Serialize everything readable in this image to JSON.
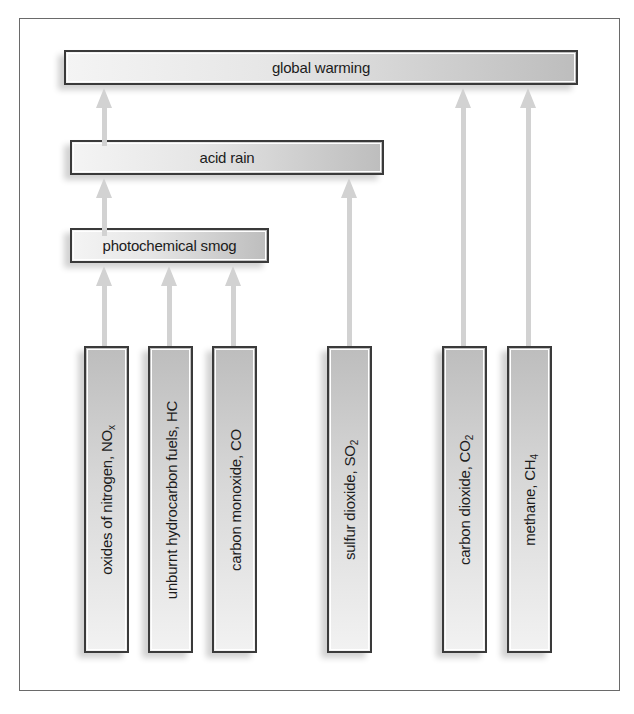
{
  "diagram": {
    "effects": [
      {
        "id": "global-warming",
        "label": "global warming"
      },
      {
        "id": "acid-rain",
        "label": "acid rain"
      },
      {
        "id": "photochemical-smog",
        "label": "photochemical smog"
      }
    ],
    "pollutants": [
      {
        "id": "nox",
        "label": "oxides of nitrogen, NO",
        "sub": "x",
        "leads_to": "photochemical smog"
      },
      {
        "id": "hc",
        "label": "unburnt hydrocarbon fuels, HC",
        "sub": "",
        "leads_to": "photochemical smog"
      },
      {
        "id": "co",
        "label": "carbon monoxide, CO",
        "sub": "",
        "leads_to": "photochemical smog"
      },
      {
        "id": "so2",
        "label": "sulfur dioxide, SO",
        "sub": "2",
        "leads_to": "acid rain"
      },
      {
        "id": "co2",
        "label": "carbon dioxide, CO",
        "sub": "2",
        "leads_to": "global warming"
      },
      {
        "id": "ch4",
        "label": "methane, CH",
        "sub": "4",
        "leads_to": "global warming"
      }
    ],
    "links": [
      {
        "from": "photochemical smog",
        "to": "acid rain"
      },
      {
        "from": "acid rain",
        "to": "global warming"
      }
    ],
    "colors": {
      "arrow": "#d2d2d2",
      "border": "#3a3a3a",
      "frame": "#6a6a6a"
    }
  }
}
